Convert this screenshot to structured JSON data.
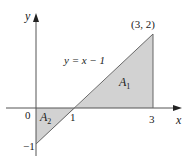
{
  "diagram": {
    "type": "area-between-line-and-x-axis",
    "line_equation_label": "y = x − 1",
    "x_axis_label": "x",
    "y_axis_label": "y",
    "origin_label": "0",
    "tick_labels": {
      "x_one": "1",
      "x_three": "3",
      "y_minus_one": "−1"
    },
    "point_label": "(3, 2)",
    "regions": [
      {
        "name": "A1",
        "label_main": "A",
        "label_sub": "1",
        "vertices": [
          [
            1,
            0
          ],
          [
            3,
            0
          ],
          [
            3,
            2
          ]
        ],
        "location": "above x-axis"
      },
      {
        "name": "A2",
        "label_main": "A",
        "label_sub": "2",
        "vertices": [
          [
            0,
            0
          ],
          [
            1,
            0
          ],
          [
            0,
            -1
          ]
        ],
        "location": "below x-axis"
      }
    ],
    "colors": {
      "fill": "#cfcfcf",
      "line": "#555555",
      "axis": "#555555",
      "text": "#1a1a1a"
    }
  }
}
